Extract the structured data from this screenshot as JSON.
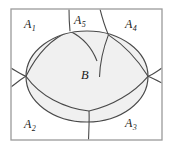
{
  "figure": {
    "colors": {
      "frame_stroke": "#9a9a9a",
      "curve_stroke": "#4a4a4a",
      "ellipse_stroke": "#4a4a4a",
      "ellipse_fill": "#f0f0f0",
      "page_background": "#ffffff",
      "label_color": "#1a1a1a"
    },
    "frame": {
      "x": 11,
      "y": 9,
      "width": 151,
      "height": 131
    },
    "ellipse": {
      "cx": 87,
      "cy": 76.5,
      "rx": 61,
      "ry": 45.5
    },
    "labels": [
      {
        "id": "a1",
        "base": "A",
        "sub": "1",
        "text": "A1"
      },
      {
        "id": "a5",
        "base": "A",
        "sub": "5",
        "text": "A5"
      },
      {
        "id": "a4",
        "base": "A",
        "sub": "4",
        "text": "A4"
      },
      {
        "id": "b",
        "base": "B",
        "sub": "",
        "text": "B"
      },
      {
        "id": "a2",
        "base": "A",
        "sub": "2",
        "text": "A2"
      },
      {
        "id": "a3",
        "base": "A",
        "sub": "3",
        "text": "A3"
      }
    ],
    "vertices": {
      "left": "26,76",
      "right": "148,76",
      "top_left_node": "70,31",
      "top_right_node": "108,35",
      "bottom_node": "89,111"
    }
  }
}
